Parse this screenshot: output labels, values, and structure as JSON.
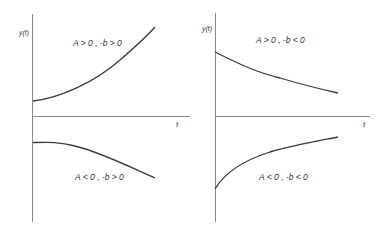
{
  "figure": {
    "panels": [
      {
        "id": "left",
        "y_axis_label": "y(t)",
        "x_axis_label": "t",
        "curves": [
          {
            "label": "A > 0 ,  -b > 0",
            "shape": "increasing, convex (growing)"
          },
          {
            "label": "A < 0 ,  -b > 0",
            "shape": "decreasing, concave (growing magnitude, negative)"
          }
        ]
      },
      {
        "id": "right",
        "y_axis_label": "y(t)",
        "x_axis_label": "t",
        "curves": [
          {
            "label": "A > 0 ,  -b < 0",
            "shape": "decreasing toward axis (decay, positive)"
          },
          {
            "label": "A < 0 ,  -b < 0",
            "shape": "increasing toward axis (decay, negative)"
          }
        ]
      }
    ]
  },
  "colors": {
    "axis": "#8a8a8a",
    "curve": "#3a3a3a",
    "text": "#333333",
    "background": "#ffffff"
  }
}
